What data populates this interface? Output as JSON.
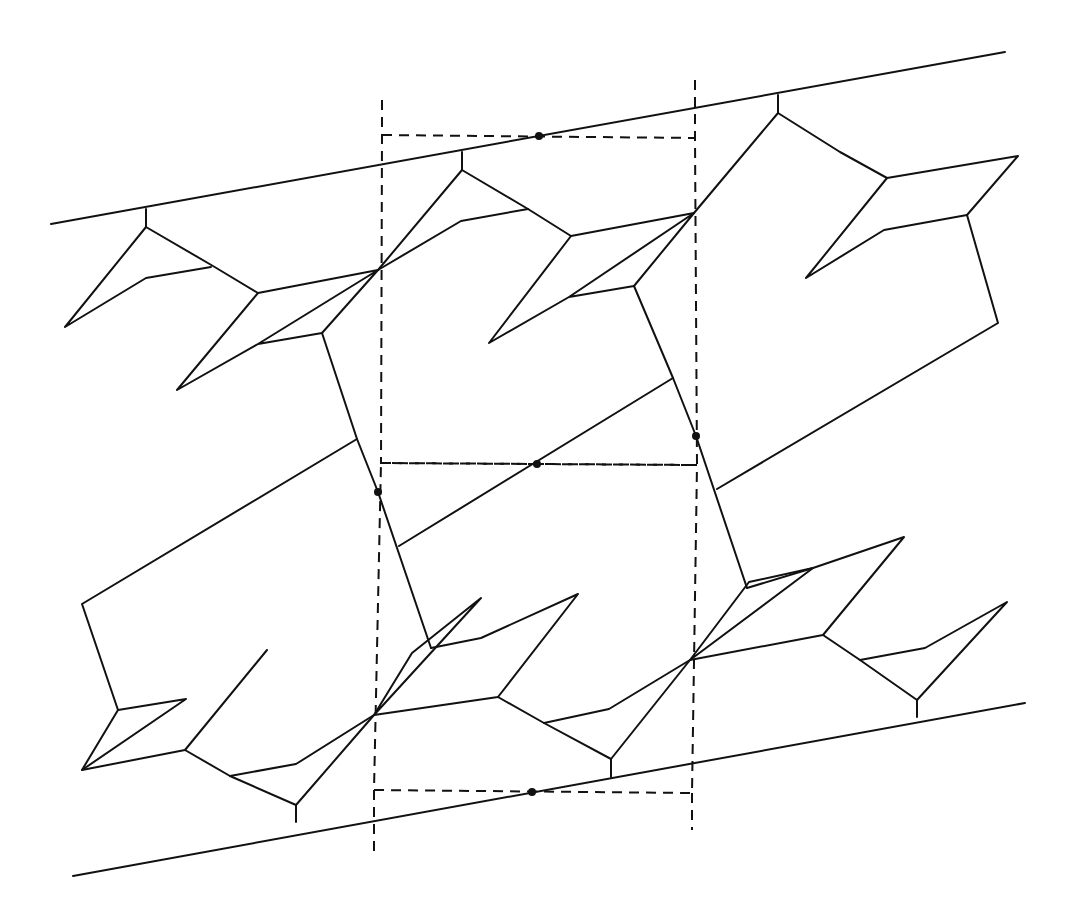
{
  "diagram": {
    "width": 1077,
    "height": 920,
    "stroke_color": "#111111",
    "background": "#ffffff",
    "boundary_lines": [
      {
        "name": "top-boundary-line",
        "points": [
          [
            51,
            224
          ],
          [
            1005,
            52
          ]
        ]
      },
      {
        "name": "bottom-boundary-line",
        "points": [
          [
            73,
            876
          ],
          [
            1025,
            703
          ]
        ]
      }
    ],
    "solid_polylines": [
      [
        [
          146,
          209
        ],
        [
          146,
          227
        ],
        [
          213,
          266
        ],
        [
          258,
          293
        ],
        [
          378,
          270
        ]
      ],
      [
        [
          146,
          227
        ],
        [
          65,
          327
        ],
        [
          146,
          278
        ],
        [
          211,
          267
        ]
      ],
      [
        [
          258,
          293
        ],
        [
          177,
          390
        ],
        [
          258,
          344
        ],
        [
          322,
          333
        ],
        [
          378,
          270
        ],
        [
          258,
          344
        ]
      ],
      [
        [
          322,
          333
        ],
        [
          357,
          439
        ],
        [
          378,
          492
        ],
        [
          431,
          648
        ]
      ],
      [
        [
          357,
          439
        ],
        [
          82,
          604
        ],
        [
          118,
          710
        ]
      ],
      [
        [
          378,
          270
        ],
        [
          462,
          170
        ],
        [
          462,
          152
        ]
      ],
      [
        [
          462,
          170
        ],
        [
          528,
          209
        ],
        [
          571,
          236
        ],
        [
          694,
          213
        ]
      ],
      [
        [
          378,
          270
        ],
        [
          461,
          221
        ],
        [
          528,
          209
        ]
      ],
      [
        [
          571,
          236
        ],
        [
          489,
          343
        ],
        [
          569,
          297
        ],
        [
          634,
          286
        ],
        [
          694,
          213
        ],
        [
          569,
          297
        ]
      ],
      [
        [
          634,
          286
        ],
        [
          673,
          378
        ],
        [
          696,
          436
        ],
        [
          747,
          588
        ]
      ],
      [
        [
          673,
          378
        ],
        [
          399,
          546
        ]
      ],
      [
        [
          694,
          213
        ],
        [
          778,
          113
        ],
        [
          778,
          95
        ]
      ],
      [
        [
          778,
          113
        ],
        [
          840,
          152
        ],
        [
          887,
          178
        ],
        [
          1018,
          156
        ],
        [
          967,
          215
        ]
      ],
      [
        [
          887,
          178
        ],
        [
          806,
          278
        ],
        [
          884,
          230
        ],
        [
          967,
          215
        ]
      ],
      [
        [
          967,
          215
        ],
        [
          998,
          323
        ],
        [
          717,
          489
        ]
      ],
      [
        [
          118,
          710
        ],
        [
          82,
          770
        ],
        [
          185,
          750
        ],
        [
          267,
          650
        ],
        [
          185,
          750
        ]
      ],
      [
        [
          118,
          710
        ],
        [
          186,
          699
        ],
        [
          82,
          770
        ]
      ],
      [
        [
          185,
          750
        ],
        [
          230,
          776
        ],
        [
          296,
          805
        ],
        [
          296,
          822
        ]
      ],
      [
        [
          230,
          776
        ],
        [
          296,
          764
        ],
        [
          374,
          715
        ]
      ],
      [
        [
          296,
          805
        ],
        [
          374,
          715
        ]
      ],
      [
        [
          374,
          715
        ],
        [
          412,
          653
        ],
        [
          481,
          598
        ],
        [
          374,
          715
        ]
      ],
      [
        [
          431,
          648
        ],
        [
          481,
          638
        ],
        [
          578,
          594
        ],
        [
          498,
          697
        ],
        [
          374,
          715
        ]
      ],
      [
        [
          498,
          697
        ],
        [
          544,
          723
        ],
        [
          611,
          759
        ],
        [
          611,
          777
        ]
      ],
      [
        [
          544,
          723
        ],
        [
          609,
          709
        ],
        [
          690,
          660
        ]
      ],
      [
        [
          611,
          759
        ],
        [
          690,
          660
        ]
      ],
      [
        [
          690,
          660
        ],
        [
          749,
          582
        ],
        [
          813,
          568
        ],
        [
          690,
          660
        ]
      ],
      [
        [
          747,
          588
        ],
        [
          813,
          568
        ],
        [
          904,
          537
        ],
        [
          823,
          635
        ],
        [
          690,
          660
        ]
      ],
      [
        [
          823,
          635
        ],
        [
          860,
          660
        ],
        [
          917,
          700
        ],
        [
          917,
          717
        ]
      ],
      [
        [
          860,
          660
        ],
        [
          925,
          648
        ],
        [
          1007,
          602
        ],
        [
          917,
          700
        ]
      ]
    ],
    "unit_cells": [
      {
        "name": "upper-cell",
        "points": [
          [
            382,
            135
          ],
          [
            695,
            138
          ],
          [
            697,
            465
          ],
          [
            381,
            463
          ]
        ]
      },
      {
        "name": "lower-cell",
        "points": [
          [
            381,
            463
          ],
          [
            697,
            465
          ],
          [
            692,
            793
          ],
          [
            374,
            790
          ]
        ]
      }
    ],
    "dashed_extensions": [
      [
        [
          382,
          100
        ],
        [
          382,
          135
        ]
      ],
      [
        [
          695,
          80
        ],
        [
          695,
          138
        ]
      ],
      [
        [
          374,
          790
        ],
        [
          374,
          855
        ]
      ],
      [
        [
          692,
          793
        ],
        [
          692,
          830
        ]
      ]
    ],
    "marked_points": [
      {
        "name": "origin-dot-top",
        "x": 539,
        "y": 136
      },
      {
        "name": "origin-dot-middle",
        "x": 537,
        "y": 464
      },
      {
        "name": "origin-dot-left",
        "x": 378,
        "y": 492
      },
      {
        "name": "origin-dot-right",
        "x": 696,
        "y": 436
      },
      {
        "name": "origin-dot-bottom",
        "x": 532,
        "y": 792
      }
    ]
  }
}
